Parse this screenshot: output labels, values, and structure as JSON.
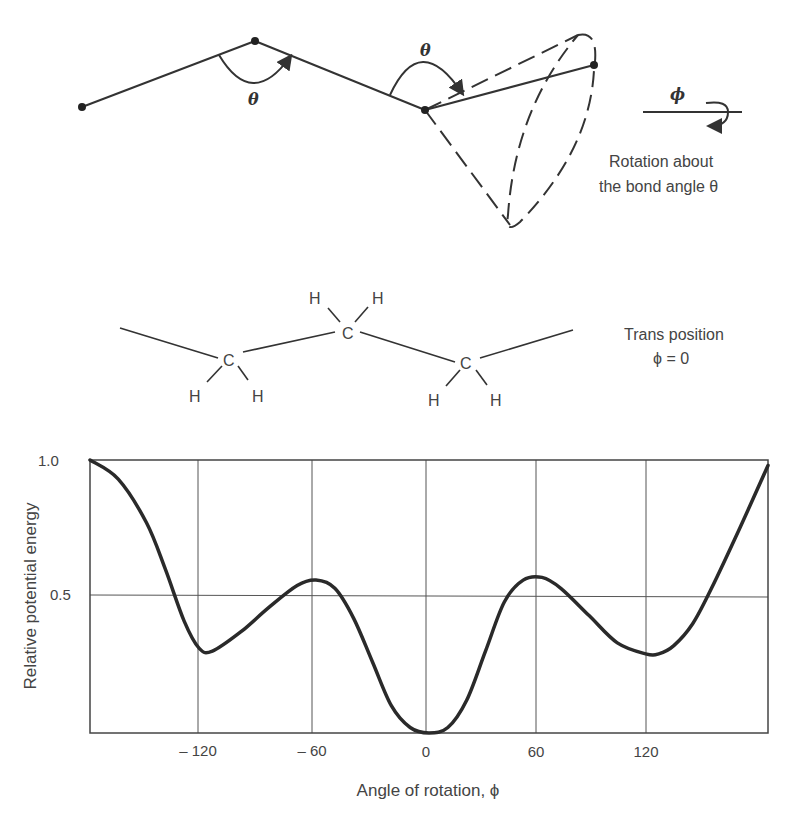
{
  "top_diagram": {
    "theta_label_1": "θ",
    "theta_label_2": "θ",
    "phi_label": "ϕ",
    "caption_line1": "Rotation about",
    "caption_line2": "the bond angle θ"
  },
  "molecule": {
    "atoms": [
      "C",
      "C",
      "C"
    ],
    "hydrogens": [
      "H",
      "H",
      "H",
      "H",
      "H",
      "H"
    ],
    "caption_line1": "Trans position",
    "caption_line2": "ϕ = 0"
  },
  "chart_data": {
    "type": "line",
    "title": "",
    "xlabel": "Angle of rotation, ϕ",
    "ylabel": "Relative potential energy",
    "xlim": [
      -180,
      180
    ],
    "ylim": [
      0,
      1.0
    ],
    "x_ticks": [
      -120,
      -60,
      0,
      60,
      120
    ],
    "x_tick_labels": [
      "– 120",
      "– 60",
      "0",
      "60",
      "120"
    ],
    "y_ticks": [
      0.5,
      1.0
    ],
    "y_tick_labels": [
      "0.5",
      "1.0"
    ],
    "grid": true,
    "series": [
      {
        "name": "Potential energy",
        "x": [
          -180,
          -165,
          -150,
          -140,
          -130,
          -122,
          -115,
          -100,
          -85,
          -70,
          -60,
          -50,
          -40,
          -30,
          -20,
          -10,
          0,
          10,
          20,
          30,
          40,
          50,
          60,
          70,
          85,
          100,
          115,
          122,
          130,
          140,
          150,
          165,
          180
        ],
        "y": [
          1.0,
          0.93,
          0.77,
          0.6,
          0.41,
          0.31,
          0.3,
          0.37,
          0.46,
          0.54,
          0.56,
          0.53,
          0.42,
          0.26,
          0.1,
          0.02,
          0.0,
          0.02,
          0.12,
          0.3,
          0.48,
          0.56,
          0.57,
          0.53,
          0.43,
          0.33,
          0.29,
          0.29,
          0.32,
          0.4,
          0.53,
          0.75,
          0.98
        ]
      }
    ]
  }
}
